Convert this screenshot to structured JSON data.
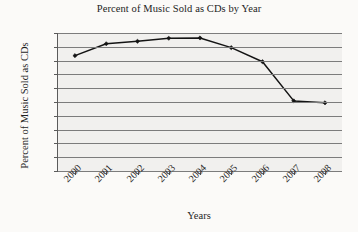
{
  "chart_data": {
    "type": "line",
    "title": "Percent of Music Sold as CDs by Year",
    "xlabel": "Years",
    "ylabel": "Percent of Music Sold as CDs",
    "categories": [
      "2000",
      "2001",
      "2002",
      "2003",
      "2004",
      "2005",
      "2006",
      "2007",
      "2008"
    ],
    "values": [
      91.8,
      96.1,
      97.0,
      98.1,
      98.2,
      94.7,
      89.6,
      75.4,
      74.7
    ],
    "series": [
      {
        "name": "Percent of Music Sold as CDs",
        "values": [
          91.8,
          96.1,
          97.0,
          98.1,
          98.2,
          94.7,
          89.6,
          75.4,
          74.7
        ]
      }
    ],
    "ylim": [
      50,
      100
    ],
    "ytick_values": [
      100,
      95,
      90,
      85,
      80,
      75,
      70,
      65,
      60,
      55,
      50
    ],
    "ytick_labels": [
      "100",
      "95",
      "90",
      "85",
      "80",
      "75",
      "70",
      "65",
      "60",
      "55",
      "50"
    ],
    "xtick_labels": [
      "2000",
      "2001",
      "2002",
      "2003",
      "2004",
      "2005",
      "2006",
      "2007",
      "2008"
    ],
    "grid": true,
    "grid_axis": "y",
    "legend": false,
    "legend_position": "none",
    "marker": "diamond",
    "line_color": "#141414",
    "grid_color": "#7c7c7c",
    "plot_background": "#f1f0ee",
    "axis_color": "#5b5b5b"
  }
}
